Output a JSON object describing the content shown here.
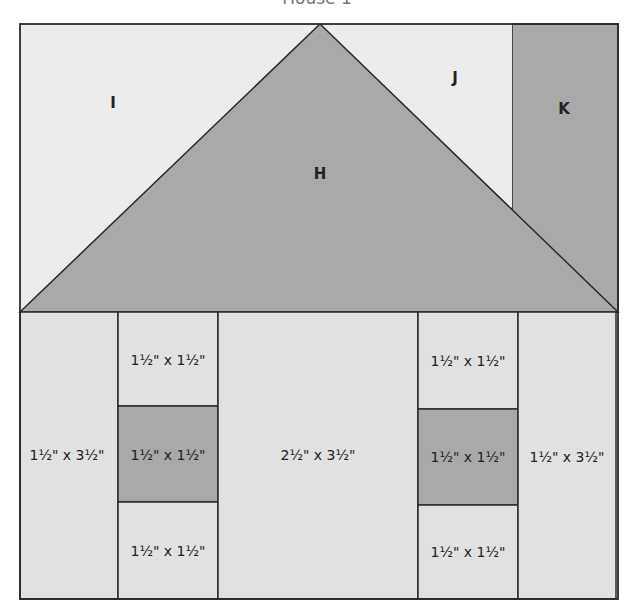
{
  "title": "House 1",
  "colors": {
    "light": "#e1e1e1",
    "lighter": "#ececec",
    "dark": "#a9a9a9",
    "stroke": "#2a2a2a"
  },
  "roof": {
    "pieces": [
      {
        "id": "I",
        "label": "I",
        "shade": "lighter"
      },
      {
        "id": "H",
        "label": "H",
        "shade": "dark"
      },
      {
        "id": "J",
        "label": "J",
        "shade": "lighter"
      },
      {
        "id": "K",
        "label": "K",
        "shade": "dark"
      }
    ]
  },
  "house": {
    "left_wall": "1½\" x 3½\"",
    "left_window_top": "1½\" x 1½\"",
    "left_window_middle": "1½\" x 1½\"",
    "left_window_bottom": "1½\" x 1½\"",
    "center_wall": "2½\" x 3½\"",
    "right_window_top": "1½\" x 1½\"",
    "right_window_middle": "1½\" x 1½\"",
    "right_window_bottom": "1½\" x 1½\"",
    "right_wall": "1½\" x 3½\""
  }
}
